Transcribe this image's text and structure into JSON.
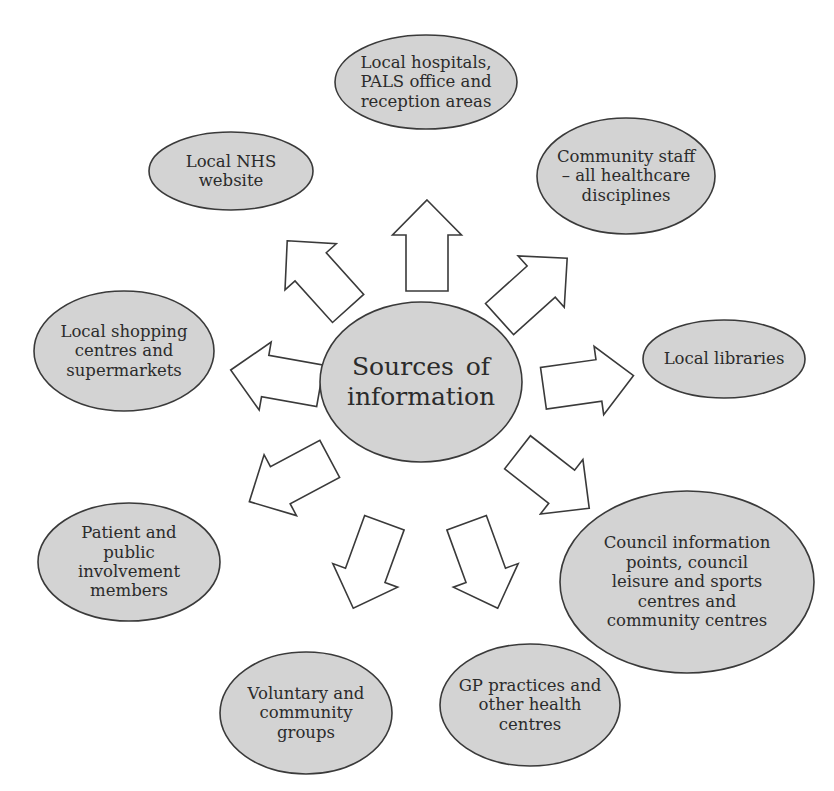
{
  "diagram": {
    "center": {
      "label": "Sources of\ninformation",
      "cx": 421,
      "cy": 382,
      "rx": 101,
      "ry": 80
    },
    "nodes": [
      {
        "id": "hospitals",
        "label": "Local hospitals,\nPALS office and\nreception areas",
        "cx": 426,
        "cy": 82,
        "rx": 91,
        "ry": 47
      },
      {
        "id": "community-staff",
        "label": "Community staff\n– all healthcare\ndisciplines",
        "cx": 626,
        "cy": 176,
        "rx": 89,
        "ry": 58
      },
      {
        "id": "nhs-website",
        "label": "Local NHS\nwebsite",
        "cx": 231,
        "cy": 171,
        "rx": 82,
        "ry": 39
      },
      {
        "id": "shopping",
        "label": "Local shopping\ncentres and\nsupermarkets",
        "cx": 124,
        "cy": 351,
        "rx": 90,
        "ry": 60
      },
      {
        "id": "libraries",
        "label": "Local libraries",
        "cx": 724,
        "cy": 359,
        "rx": 81,
        "ry": 39
      },
      {
        "id": "council",
        "label": "Council information\npoints, council\nleisure and sports\ncentres and\ncommunity centres",
        "cx": 687,
        "cy": 582,
        "rx": 127,
        "ry": 91
      },
      {
        "id": "patient-public",
        "label": "Patient and\npublic\ninvolvement\nmembers",
        "cx": 129,
        "cy": 562,
        "rx": 91,
        "ry": 59
      },
      {
        "id": "voluntary",
        "label": "Voluntary and\ncommunity\ngroups",
        "cx": 306,
        "cy": 713,
        "rx": 86,
        "ry": 61
      },
      {
        "id": "gp-practices",
        "label": "GP practices and\nother health\ncentres",
        "cx": 530,
        "cy": 705,
        "rx": 90,
        "ry": 61
      }
    ],
    "arrows": [
      {
        "id": "to-hospitals",
        "cx": 427,
        "cy": 246,
        "angle": 0
      },
      {
        "id": "to-community-staff",
        "cx": 533,
        "cy": 289,
        "angle": 48
      },
      {
        "id": "to-nhs-website",
        "cx": 318,
        "cy": 275,
        "angle": -42
      },
      {
        "id": "to-shopping",
        "cx": 276,
        "cy": 378,
        "angle": -80
      },
      {
        "id": "to-libraries",
        "cx": 588,
        "cy": 382,
        "angle": 82
      },
      {
        "id": "to-council",
        "cx": 553,
        "cy": 480,
        "angle": 128
      },
      {
        "id": "to-patient-public",
        "cx": 290,
        "cy": 480,
        "angle": -118
      },
      {
        "id": "to-voluntary",
        "cx": 369,
        "cy": 565,
        "angle": -160
      },
      {
        "id": "to-gp-practices",
        "cx": 482,
        "cy": 565,
        "angle": 160
      }
    ],
    "colors": {
      "ellipse_fill": "#d3d3d3",
      "stroke": "#3a3a3a",
      "text": "#2b2b2b",
      "arrow_fill": "#ffffff"
    }
  }
}
